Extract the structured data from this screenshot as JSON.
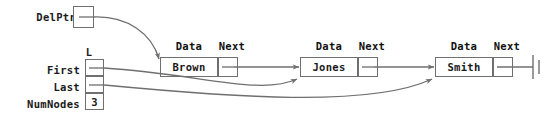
{
  "diagram": {
    "line_color": "#6f6f6f",
    "text_color": "#1a1a1a",
    "background": "#ffffff"
  },
  "pointers": {
    "delptr": {
      "label": "DelPtr",
      "value": ""
    }
  },
  "list_header": {
    "name": "L",
    "fields": [
      {
        "label": "First",
        "value": ""
      },
      {
        "label": "Last",
        "value": ""
      },
      {
        "label": "NumNodes",
        "value": "3"
      }
    ]
  },
  "nodes": [
    {
      "data_header": "Data",
      "next_header": "Next",
      "data": "Brown",
      "next": ""
    },
    {
      "data_header": "Data",
      "next_header": "Next",
      "data": "Jones",
      "next": ""
    },
    {
      "data_header": "Data",
      "next_header": "Next",
      "data": "Smith",
      "next": ""
    }
  ],
  "terminator": {
    "symbol": "null-ground-symbol"
  }
}
